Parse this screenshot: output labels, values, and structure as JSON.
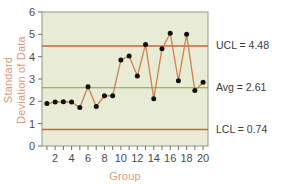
{
  "chart_data": {
    "type": "line",
    "title": "",
    "subtitle": "",
    "xlabel": "Group",
    "ylabel": "Standard Deviation of Data",
    "ylabel_line1": "Standard",
    "ylabel_line2": "Deviation of Data",
    "x": [
      1,
      2,
      3,
      4,
      5,
      6,
      7,
      8,
      9,
      10,
      11,
      12,
      13,
      14,
      15,
      16,
      17,
      18,
      19,
      20
    ],
    "values": [
      1.9,
      1.97,
      1.98,
      1.97,
      1.72,
      2.65,
      1.77,
      2.25,
      2.25,
      3.85,
      4.03,
      3.13,
      4.55,
      2.12,
      4.35,
      5.05,
      2.92,
      5.0,
      2.48,
      2.85
    ],
    "series": [
      {
        "name": "Standard Deviation of Data",
        "values": [
          1.9,
          1.97,
          1.98,
          1.97,
          1.72,
          2.65,
          1.77,
          2.25,
          2.25,
          3.85,
          4.03,
          3.13,
          4.55,
          2.12,
          4.35,
          5.05,
          2.92,
          5.0,
          2.48,
          2.85
        ],
        "color": "#d08050",
        "marker": "circle",
        "marker_color": "#111111"
      }
    ],
    "xlim": [
      0.4,
      20.6
    ],
    "ylim": [
      0,
      6
    ],
    "x_ticks": [
      2,
      4,
      6,
      8,
      10,
      12,
      14,
      16,
      18,
      20
    ],
    "x_minor_ticks": [
      1,
      3,
      5,
      7,
      9,
      11,
      13,
      15,
      17,
      19
    ],
    "x_tick_labels": [
      "2",
      "4",
      "6",
      "8",
      "10",
      "12",
      "14",
      "16",
      "18",
      "20"
    ],
    "y_ticks": [
      0,
      1,
      2,
      3,
      4,
      5,
      6
    ],
    "y_tick_labels": [
      "0",
      "1",
      "2",
      "3",
      "4",
      "5",
      "6"
    ],
    "grid": false,
    "legend": "none",
    "plot_background": "#e8ecd4",
    "reference_lines": [
      {
        "id": "ucl",
        "label": "UCL = 4.48",
        "value": 4.48,
        "color": "#c8663c"
      },
      {
        "id": "avg",
        "label": "Avg = 2.61",
        "value": 2.61,
        "color": "#8a9a4a"
      },
      {
        "id": "lcl",
        "label": "LCL = 0.74",
        "value": 0.74,
        "color": "#c8663c"
      }
    ]
  },
  "labels": {
    "ucl": "UCL = 4.48",
    "avg": "Avg = 2.61",
    "lcl": "LCL = 0.74",
    "xaxis": "Group",
    "yaxis_line1": "Standard",
    "yaxis_line2": "Deviation of Data"
  }
}
